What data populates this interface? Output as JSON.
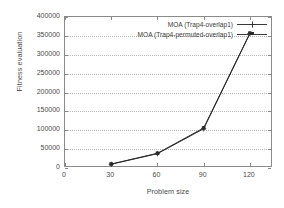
{
  "chart_data": {
    "type": "line",
    "title": "",
    "xlabel": "Problem size",
    "ylabel": "Fitness evaluation",
    "xlim": [
      0,
      135
    ],
    "ylim": [
      0,
      400000
    ],
    "xticks": [
      0,
      30,
      60,
      90,
      120
    ],
    "yticks": [
      0,
      50000,
      100000,
      150000,
      200000,
      250000,
      300000,
      350000,
      400000
    ],
    "xtick_labels": [
      "0",
      "30",
      "60",
      "90",
      "120"
    ],
    "ytick_labels": [
      "0",
      "50000",
      "100000",
      "150000",
      "200000",
      "250000",
      "300000",
      "350000",
      "400000"
    ],
    "grid": "horizontal-dotted",
    "legend_position": "top-right-inside",
    "x": [
      30,
      60,
      90,
      120
    ],
    "series": [
      {
        "name": "MOA (Trap4-overlap1)",
        "marker": "plus",
        "color": "#2a2a2a",
        "values": [
          10000,
          38000,
          104000,
          356000
        ]
      },
      {
        "name": "MOA (Trap4-permuted-overlap1)",
        "marker": "square",
        "color": "#2a2a2a",
        "values": [
          10500,
          39000,
          106000,
          357000
        ]
      }
    ]
  },
  "axes": {
    "y_title": "Fitness evaluation",
    "x_title": "Problem size"
  },
  "legend": {
    "entries": [
      {
        "label": "MOA (Trap4-overlap1)",
        "marker": "plus"
      },
      {
        "label": "MOA (Trap4-permuted-overlap1)",
        "marker": "square"
      }
    ]
  },
  "colors": {
    "line": "#2a2a2a",
    "axis": "#8a8a8a",
    "grid": "#b4b4b4",
    "text": "#4a4a4a",
    "background": "#ffffff"
  }
}
